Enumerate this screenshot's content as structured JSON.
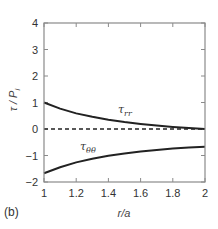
{
  "chart_data": {
    "type": "line",
    "title": "",
    "panel_label": "(b)",
    "xlabel": "r/a",
    "ylabel": "τ / P_i",
    "ylabel_main": "τ / P",
    "ylabel_sub": "i",
    "xlim": [
      1,
      2
    ],
    "ylim": [
      -2,
      4
    ],
    "xticks": [
      1,
      1.2,
      1.4,
      1.6,
      1.8,
      2
    ],
    "xtick_labels": [
      "1",
      "1.2",
      "1.4",
      "1.6",
      "1.8",
      "2"
    ],
    "yticks": [
      -2,
      -1,
      0,
      1,
      2,
      3,
      4
    ],
    "ytick_labels": [
      "−2",
      "−1",
      "0",
      "1",
      "2",
      "3",
      "4"
    ],
    "grid": false,
    "legend": "none (inline labels)",
    "x": [
      1.0,
      1.1,
      1.2,
      1.3,
      1.4,
      1.5,
      1.6,
      1.7,
      1.8,
      1.9,
      2.0
    ],
    "series": [
      {
        "name": "τ_rr",
        "label_main": "τ",
        "label_sub": "rr",
        "style": "solid",
        "values": [
          1.0,
          0.77,
          0.59,
          0.46,
          0.35,
          0.26,
          0.19,
          0.13,
          0.08,
          0.04,
          0.0
        ]
      },
      {
        "name": "τ_θθ",
        "label_main": "τ",
        "label_sub": "θθ",
        "style": "solid",
        "values": [
          -1.67,
          -1.44,
          -1.26,
          -1.12,
          -1.01,
          -0.93,
          -0.85,
          -0.79,
          -0.74,
          -0.7,
          -0.67
        ]
      },
      {
        "name": "zero",
        "style": "dashed",
        "values": [
          0,
          0,
          0,
          0,
          0,
          0,
          0,
          0,
          0,
          0,
          0
        ]
      }
    ],
    "annotations": [
      {
        "text": "τ_rr",
        "x": 1.55,
        "y": 0.65
      },
      {
        "text": "τ_θθ",
        "x": 1.55,
        "y": -0.75
      }
    ]
  }
}
